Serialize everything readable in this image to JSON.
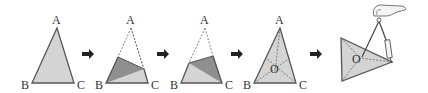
{
  "colors": {
    "fill_light": "#d4d4d4",
    "fill_dark": "#8f8f8f",
    "edge": "#555555",
    "arrow": "#222222",
    "background": "#ffffff"
  },
  "steps": [
    {
      "id": 1,
      "labels": {
        "A": "A",
        "B": "B",
        "C": "C"
      },
      "description": "Triangle ABC"
    },
    {
      "id": 2,
      "labels": {
        "A": "A",
        "B": "B",
        "C": "C"
      },
      "description": "Fold to bisect angle B"
    },
    {
      "id": 3,
      "labels": {
        "A": "A",
        "B": "B",
        "C": "C"
      },
      "description": "Fold to bisect angle C"
    },
    {
      "id": 4,
      "labels": {
        "A": "A",
        "B": "B",
        "C": "C",
        "O": "O"
      },
      "description": "Angle bisectors meet at O"
    },
    {
      "id": 5,
      "labels": {
        "O": "O"
      },
      "description": "Draw inscribed circle with compass centered at O"
    }
  ],
  "arrows": [
    "right-arrow",
    "right-arrow",
    "right-arrow",
    "right-arrow"
  ]
}
